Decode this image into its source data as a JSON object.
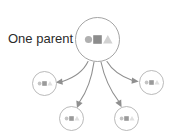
{
  "diagram": {
    "title_label": "One parent",
    "type": "parent-to-children inheritance diagram",
    "colors": {
      "background": "#ffffff",
      "ring_stroke": "#9a9a9a",
      "child_ring_stroke": "#a8a8a8",
      "edge_stroke": "#8f8f8f",
      "label_text": "#2b2b2b",
      "shape_circle": "#b0b0b0",
      "shape_square": "#8c8c8c",
      "shape_triangle": "#d2d2d2"
    },
    "parent": {
      "name": "parent-node",
      "label": "One parent",
      "shapes": [
        {
          "kind": "circle",
          "color": "#b0b0b0"
        },
        {
          "kind": "square",
          "color": "#8c8c8c"
        },
        {
          "kind": "triangle",
          "color": "#d2d2d2"
        }
      ]
    },
    "children": [
      {
        "name": "child-node-left",
        "position": "left",
        "shapes": [
          {
            "kind": "circle",
            "color": "#c4c4c4"
          },
          {
            "kind": "square",
            "color": "#9a9a9a"
          },
          {
            "kind": "triangle",
            "color": "#e0e0e0"
          }
        ]
      },
      {
        "name": "child-node-bottom-left",
        "position": "bottom-left",
        "shapes": [
          {
            "kind": "circle",
            "color": "#c4c4c4"
          },
          {
            "kind": "square",
            "color": "#9a9a9a"
          },
          {
            "kind": "triangle",
            "color": "#e0e0e0"
          }
        ]
      },
      {
        "name": "child-node-bottom-right",
        "position": "bottom-right",
        "shapes": [
          {
            "kind": "circle",
            "color": "#c4c4c4"
          },
          {
            "kind": "square",
            "color": "#9a9a9a"
          },
          {
            "kind": "triangle",
            "color": "#e0e0e0"
          }
        ]
      },
      {
        "name": "child-node-right",
        "position": "right",
        "shapes": [
          {
            "kind": "circle",
            "color": "#c4c4c4"
          },
          {
            "kind": "square",
            "color": "#9a9a9a"
          },
          {
            "kind": "triangle",
            "color": "#e0e0e0"
          }
        ]
      }
    ],
    "edges": [
      {
        "name": "edge-to-left",
        "from": "parent-node",
        "to": "child-node-left"
      },
      {
        "name": "edge-to-bottom-left",
        "from": "parent-node",
        "to": "child-node-bottom-left"
      },
      {
        "name": "edge-to-bottom-right",
        "from": "parent-node",
        "to": "child-node-bottom-right"
      },
      {
        "name": "edge-to-right",
        "from": "parent-node",
        "to": "child-node-right"
      }
    ]
  }
}
